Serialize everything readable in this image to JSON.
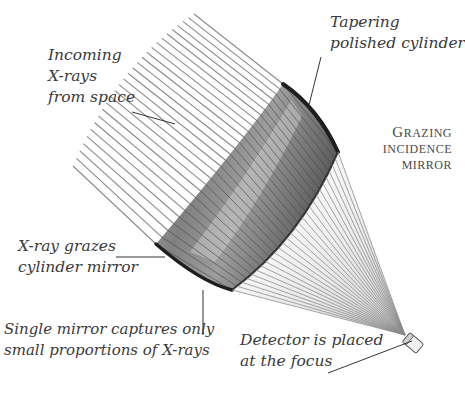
{
  "title": "Grazing Incidence Mirror",
  "heading": {
    "first_letter": "G",
    "line1_rest": "RAZING",
    "line2": "INCIDENCE",
    "line3": "MIRROR"
  },
  "labels": {
    "incoming": [
      "Incoming",
      "X-rays",
      "from space"
    ],
    "tapering": [
      "Tapering",
      "polished cylinder"
    ],
    "grazes": [
      "X-ray grazes",
      "cylinder mirror"
    ],
    "single": [
      "Single mirror captures only",
      "small proportions of X-rays"
    ],
    "detector": [
      "Detector is placed",
      "at the focus"
    ]
  },
  "colors": {
    "ray": "#8a8a8a",
    "mirror_dark": "#1e1e1e",
    "mirror_mid": "#6e6e6e",
    "mirror_light": "#c8c8c8",
    "text": "#3a3a3a"
  },
  "diagram": {
    "ray_count": 28,
    "focus_point": [
      405,
      335
    ],
    "detector_angle_deg": 40
  }
}
